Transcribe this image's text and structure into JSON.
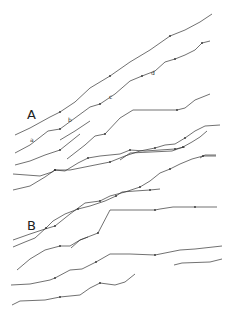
{
  "figure": {
    "panels": [
      {
        "label": "A",
        "x": 27,
        "y": 108
      },
      {
        "label": "B",
        "x": 27,
        "y": 219
      }
    ],
    "trace_labels": [
      {
        "label": "a",
        "x": 30,
        "y": 137
      },
      {
        "label": "b",
        "x": 68,
        "y": 117
      },
      {
        "label": "c",
        "x": 109,
        "y": 94
      },
      {
        "label": "d",
        "x": 151,
        "y": 70
      }
    ],
    "stroke_color": "#333333",
    "traces": [
      {
        "name": "A1",
        "points": "15,135 30,128 50,117 60,112 75,102 90,88 110,76 130,62 150,50 170,36 185,30 200,22 212,14"
      },
      {
        "name": "A2",
        "points": "15,153 30,145 48,131 60,129 75,118 90,107 100,104 115,94 130,81 142,76 155,71 165,62 175,59 185,55 195,50 202,43 210,41"
      },
      {
        "name": "A3",
        "points": "67,159 85,145 95,136 105,134 120,118 133,110 177,110 185,108 195,100 210,94"
      },
      {
        "name": "A4",
        "points": "120,160 130,153 172,151 183,147 192,142 200,137 207,131"
      },
      {
        "name": "A5",
        "points": "200,158 205,155 216,155"
      },
      {
        "name": "A6",
        "points": "15,165 30,161 45,155 60,150 70,142 80,134"
      },
      {
        "name": "A7",
        "points": "13,174 40,176 52,172 55,170 65,171 78,163 88,158 100,156 120,154 130,150 145,151 160,150 175,149 185,147"
      },
      {
        "name": "A8",
        "points": "13,190 30,186 45,177 55,170 70,170 90,166 110,162 125,156 140,151 155,148 165,145 175,144 185,138 195,131 205,126 220,125"
      },
      {
        "name": "A9",
        "points": "13,240 30,234 45,229 55,226 70,214 85,203 100,201 110,196 125,192 140,187 150,181 160,173 170,169 180,164 192,159 203,156 216,156"
      },
      {
        "name": "B1",
        "points": "13,247 25,242 35,238 46,228 53,221 65,214 78,209 90,206 105,201 116,196 122,192 135,191 150,190 160,189"
      },
      {
        "name": "B2",
        "points": "17,270 30,259 45,250 60,246 70,246 80,240 98,233 110,210 125,210 155,210 160,209 173,207 195,207 217,207"
      },
      {
        "name": "B3",
        "points": "71,248 80,240 88,237"
      },
      {
        "name": "B4",
        "points": "11,285 30,284 50,280 55,278 70,270 82,269 96,262 110,254 130,254 155,255 180,250 195,249 222,246"
      },
      {
        "name": "B5",
        "points": "174,265 182,263 210,262 222,259"
      },
      {
        "name": "B6",
        "points": "12,305 20,301 45,300 60,297 80,295 90,288 100,283 115,285 125,282 135,274"
      },
      {
        "name": "B7",
        "points": "60,140 75,131 90,121"
      }
    ]
  }
}
